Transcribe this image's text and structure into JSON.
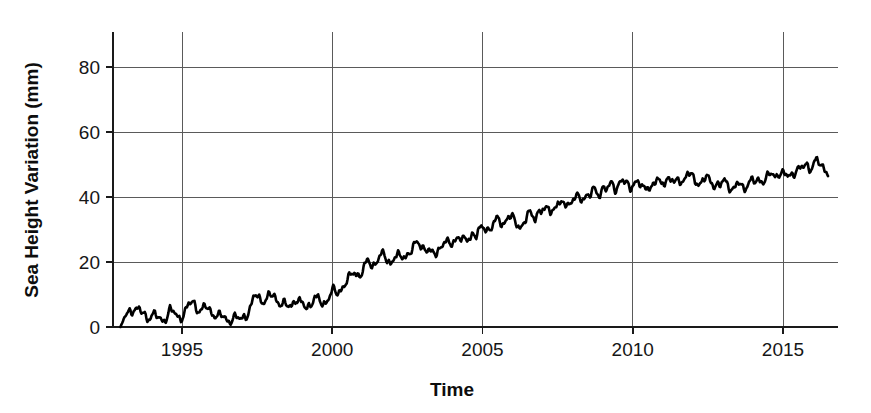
{
  "chart_data": {
    "type": "line",
    "title": "",
    "xlabel": "Time",
    "ylabel": "Sea Height Variation (mm)",
    "xlim": [
      1992.6,
      1992.6
    ],
    "ylim": [
      -4,
      95
    ],
    "grid": true,
    "legend": false,
    "xticks": [
      1995,
      2000,
      2005,
      2010,
      2015
    ],
    "xtick_labels": [
      "1995",
      "2000",
      "2005",
      "2010",
      "2015"
    ],
    "yticks": [
      0,
      20,
      40,
      60,
      80
    ],
    "ytick_labels": [
      "0",
      "20",
      "40",
      "60",
      "80"
    ],
    "line_color": "#000000",
    "series": [
      {
        "name": "Sea Height Variation",
        "x": [
          1992.95,
          1993.1,
          1993.25,
          1993.4,
          1993.55,
          1993.7,
          1993.85,
          1994.0,
          1994.15,
          1994.3,
          1994.45,
          1994.6,
          1994.75,
          1994.9,
          1995.05,
          1995.2,
          1995.35,
          1995.5,
          1995.65,
          1995.8,
          1995.95,
          1996.1,
          1996.25,
          1996.4,
          1996.55,
          1996.7,
          1996.85,
          1997.0,
          1997.15,
          1997.3,
          1997.45,
          1997.6,
          1997.75,
          1997.9,
          1998.05,
          1998.2,
          1998.35,
          1998.5,
          1998.65,
          1998.8,
          1998.95,
          1999.1,
          1999.25,
          1999.4,
          1999.55,
          1999.7,
          1999.85,
          2000.0,
          2000.15,
          2000.3,
          2000.45,
          2000.6,
          2000.75,
          2000.9,
          2001.05,
          2001.2,
          2001.35,
          2001.5,
          2001.65,
          2001.8,
          2001.95,
          2002.1,
          2002.25,
          2002.4,
          2002.55,
          2002.7,
          2002.85,
          2003.0,
          2003.15,
          2003.3,
          2003.45,
          2003.6,
          2003.75,
          2003.9,
          2004.05,
          2004.2,
          2004.35,
          2004.5,
          2004.65,
          2004.8,
          2004.95,
          2005.1,
          2005.25,
          2005.4,
          2005.55,
          2005.7,
          2005.85,
          2006.0,
          2006.15,
          2006.3,
          2006.45,
          2006.6,
          2006.75,
          2006.9,
          2007.05,
          2007.2,
          2007.35,
          2007.5,
          2007.65,
          2007.8,
          2007.95,
          2008.1,
          2008.25,
          2008.4,
          2008.55,
          2008.7,
          2008.85,
          2009.0,
          2009.15,
          2009.3,
          2009.45,
          2009.6,
          2009.75,
          2009.9,
          2010.05,
          2010.2,
          2010.35,
          2010.5,
          2010.65,
          2010.8,
          2010.95,
          2011.1,
          2011.25,
          2011.4,
          2011.55,
          2011.7,
          2011.85,
          2012.0,
          2012.15,
          2012.3,
          2012.45,
          2012.6,
          2012.75,
          2012.9,
          2013.05,
          2013.2,
          2013.35,
          2013.5,
          2013.65,
          2013.8,
          2013.95,
          2014.1,
          2014.25,
          2014.4,
          2014.55,
          2014.7,
          2014.85,
          2015.0,
          2015.15,
          2015.3,
          2015.45,
          2015.6,
          2015.75,
          2015.9,
          2016.05,
          2016.2,
          2016.35,
          2016.5
        ],
        "values": [
          0,
          3,
          5,
          6,
          5,
          4,
          3,
          4,
          3,
          2,
          3,
          5,
          4,
          3,
          4,
          6,
          8,
          6,
          5,
          6,
          5,
          4,
          3,
          3,
          2,
          3,
          2,
          3,
          4,
          6,
          10,
          9,
          8,
          9,
          10,
          8,
          7,
          6,
          7,
          9,
          7,
          6,
          7,
          9,
          8,
          7,
          9,
          11,
          10,
          12,
          14,
          15,
          17,
          16,
          18,
          20,
          19,
          21,
          22,
          21,
          20,
          22,
          21,
          22,
          23,
          24,
          26,
          25,
          24,
          22,
          23,
          25,
          26,
          25,
          27,
          28,
          26,
          27,
          29,
          28,
          30,
          31,
          30,
          32,
          33,
          32,
          34,
          33,
          32,
          31,
          33,
          35,
          34,
          36,
          35,
          37,
          36,
          38,
          37,
          39,
          38,
          40,
          39,
          41,
          40,
          42,
          41,
          43,
          42,
          44,
          43,
          45,
          44,
          43,
          45,
          44,
          42,
          44,
          43,
          45,
          44,
          46,
          45,
          44,
          46,
          45,
          47,
          46,
          45,
          44,
          46,
          45,
          44,
          43,
          45,
          44,
          42,
          44,
          43,
          44,
          45,
          44,
          46,
          45,
          47,
          46,
          48,
          47,
          46,
          47,
          49,
          48,
          50,
          49,
          51,
          50,
          49,
          48
        ]
      }
    ]
  },
  "axes": {
    "x_title": "Time",
    "y_title": "Sea Height Variation (mm)"
  }
}
